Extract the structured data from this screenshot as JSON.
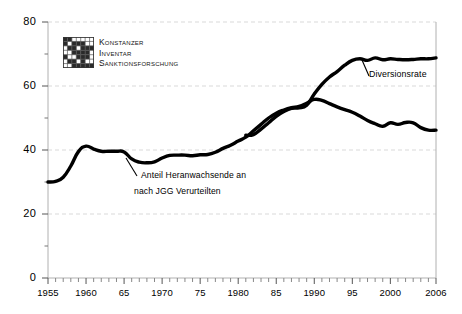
{
  "logo": {
    "name": "kis-logo",
    "lines": [
      "Konstanzer",
      "Inventar",
      "Sanktionsforschung"
    ]
  },
  "annotations": {
    "jgg_line1": "Anteil Heranwachsende an",
    "jgg_line2": "nach JGG Verurteilten",
    "diversion": "Diversionsrate"
  },
  "axes": {
    "y_ticks": [
      "0",
      "20",
      "40",
      "60",
      "80"
    ],
    "y_minor_ticks": [
      10,
      30,
      50,
      70
    ],
    "x_ticks": [
      "1955",
      "1960",
      "65",
      "1970",
      "75",
      "1980",
      "85",
      "1990",
      "95",
      "2000",
      "2006"
    ],
    "x_tick_years": [
      1955,
      1960,
      1965,
      1970,
      1975,
      1980,
      1985,
      1990,
      1995,
      2000,
      2006
    ]
  },
  "colors": {
    "line": "#000000",
    "grid": "#d9d9d9",
    "axis": "#b0b0b0",
    "background": "#ffffff"
  },
  "chart_data": {
    "type": "line",
    "title": "",
    "subtitle": "",
    "xlabel": "",
    "ylabel": "",
    "xlim": [
      1955,
      2006
    ],
    "ylim": [
      0,
      80
    ],
    "grid": true,
    "grid_style": "dashed-horizontal",
    "legend": "inline-annotations",
    "legend_position": "none",
    "series": [
      {
        "name": "Anteil Heranwachsende an nach JGG Verurteilten",
        "label_on_plot": "Anteil Heranwachsende an nach JGG Verurteilten",
        "x": [
          1955,
          1956,
          1957,
          1958,
          1959,
          1960,
          1961,
          1962,
          1963,
          1964,
          1965,
          1966,
          1967,
          1968,
          1969,
          1970,
          1971,
          1972,
          1973,
          1974,
          1975,
          1976,
          1977,
          1978,
          1979,
          1980,
          1981,
          1982,
          1983,
          1984,
          1985,
          1986,
          1987,
          1988,
          1989,
          1990,
          1991,
          1992,
          1993,
          1994,
          1995,
          1996,
          1997,
          1998,
          1999,
          2000,
          2001,
          2002,
          2003,
          2004,
          2005,
          2006
        ],
        "values": [
          30.0,
          30.2,
          31.5,
          35.0,
          39.5,
          41.2,
          40.3,
          39.6,
          39.6,
          39.6,
          39.4,
          37.2,
          36.2,
          36.0,
          36.3,
          37.5,
          38.3,
          38.4,
          38.4,
          38.2,
          38.5,
          38.6,
          39.3,
          40.5,
          41.5,
          42.8,
          44.0,
          46.0,
          48.0,
          50.0,
          51.5,
          52.5,
          53.2,
          53.6,
          54.6,
          55.8,
          55.5,
          54.5,
          53.5,
          52.6,
          51.8,
          50.6,
          49.2,
          48.2,
          47.4,
          48.5,
          48.0,
          48.6,
          48.5,
          47.0,
          46.2,
          46.2
        ]
      },
      {
        "name": "Diversionsrate",
        "label_on_plot": "Diversionsrate",
        "x": [
          1981,
          1982,
          1983,
          1984,
          1985,
          1986,
          1987,
          1988,
          1989,
          1990,
          1991,
          1992,
          1993,
          1994,
          1995,
          1996,
          1997,
          1998,
          1999,
          2000,
          2001,
          2002,
          2003,
          2004,
          2005,
          2006
        ],
        "values": [
          44.6,
          44.8,
          46.5,
          48.5,
          50.5,
          52.0,
          53.0,
          53.2,
          54.0,
          57.5,
          60.5,
          62.8,
          64.5,
          66.5,
          68.0,
          68.5,
          68.0,
          68.8,
          68.2,
          68.5,
          68.3,
          68.2,
          68.3,
          68.5,
          68.5,
          68.8
        ]
      }
    ]
  }
}
